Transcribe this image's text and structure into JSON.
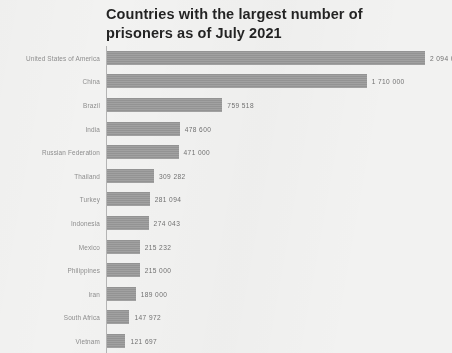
{
  "document": {
    "kind": "scanned-bar-chart"
  },
  "chart_data": {
    "type": "bar",
    "orientation": "horizontal",
    "title": "Countries with the largest number of prisoners as of July 2021",
    "title_line1": "Countries with the largest number of",
    "title_line2": "prisoners as of July 2021",
    "xlabel": "",
    "ylabel": "",
    "grid": false,
    "legend": null,
    "xlim": [
      0,
      2094000
    ],
    "bar_color": "#9a9a9a",
    "categories": [
      "United States of America",
      "China",
      "Brazil",
      "India",
      "Russian Federation",
      "Thailand",
      "Turkey",
      "Indonesia",
      "Mexico",
      "Philippines",
      "Iran",
      "South Africa",
      "Vietnam"
    ],
    "values": [
      2094000,
      1710000,
      759518,
      478600,
      471000,
      309282,
      281094,
      274043,
      215232,
      215000,
      189000,
      147972,
      121697
    ],
    "value_labels": [
      "2 094 000",
      "1 710 000",
      "759 518",
      "478 600",
      "471 000",
      "309 282",
      "281 094",
      "274 043",
      "215 232",
      "215 000",
      "189 000",
      "147 972",
      "121 697"
    ]
  }
}
